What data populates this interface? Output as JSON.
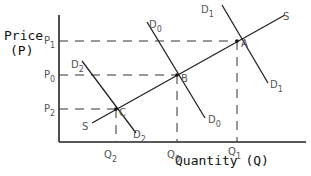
{
  "diagram": {
    "type": "supply-demand",
    "y_axis_title_line1": "Price",
    "y_axis_title_line2": "(P)",
    "x_axis_title": "Quantity (Q)",
    "price_levels": [
      {
        "label": "P",
        "sub": "1",
        "y": 41
      },
      {
        "label": "P",
        "sub": "0",
        "y": 75
      },
      {
        "label": "P",
        "sub": "2",
        "y": 109
      }
    ],
    "quantity_levels": [
      {
        "label": "Q",
        "sub": "2",
        "x": 116
      },
      {
        "label": "Q",
        "sub": "0",
        "x": 177
      },
      {
        "label": "Q",
        "sub": "1",
        "x": 237
      }
    ],
    "points": [
      {
        "label": "A",
        "x": 237,
        "y": 41
      },
      {
        "label": "B",
        "x": 177,
        "y": 75
      },
      {
        "label": "C",
        "x": 116,
        "y": 109
      }
    ],
    "curves": {
      "supply": {
        "label": "S"
      },
      "d1": {
        "label": "D",
        "sub": "1"
      },
      "d0": {
        "label": "D",
        "sub": "0"
      },
      "d2": {
        "label": "D",
        "sub": "2"
      }
    },
    "line_color": "#222222",
    "dash_color": "#333333"
  }
}
